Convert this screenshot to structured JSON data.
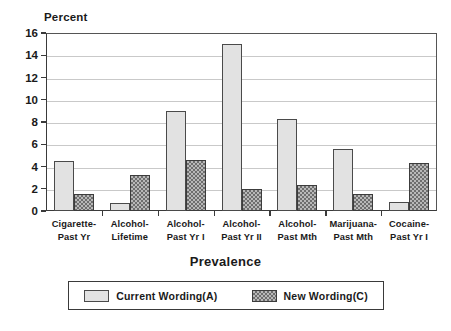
{
  "chart_data": {
    "type": "bar",
    "title": "",
    "xlabel": "Prevalence",
    "ylabel": "Percent",
    "ylim": [
      0,
      16
    ],
    "yticks": [
      0,
      2,
      4,
      6,
      8,
      10,
      12,
      14,
      16
    ],
    "grid": true,
    "legend_position": "bottom",
    "categories": [
      "Cigarette-Past Yr",
      "Alcohol-Lifetime",
      "Alcohol-Past Yr I",
      "Alcohol-Past Yr II",
      "Alcohol-Past Mth",
      "Marijuana-Past Mth",
      "Cocaine-Past Yr I"
    ],
    "category_lines": [
      [
        "Cigarette-",
        "Past Yr"
      ],
      [
        "Alcohol-",
        "Lifetime"
      ],
      [
        "Alcohol-",
        "Past Yr I"
      ],
      [
        "Alcohol-",
        "Past Yr II"
      ],
      [
        "Alcohol-",
        "Past Mth"
      ],
      [
        "Marijuana-",
        "Past Mth"
      ],
      [
        "Cocaine-",
        "Past Yr I"
      ]
    ],
    "series": [
      {
        "name": "Current Wording(A)",
        "values": [
          4.5,
          0.7,
          9.0,
          15.0,
          8.3,
          5.6,
          0.8
        ]
      },
      {
        "name": "New Wording(C)",
        "values": [
          1.5,
          3.2,
          4.6,
          2.0,
          2.3,
          1.5,
          4.3
        ]
      }
    ]
  },
  "legend": {
    "items": [
      {
        "label": "Current Wording(A)"
      },
      {
        "label": "New Wording(C)"
      }
    ]
  },
  "colors": {
    "series_a_fill": "#e2e2e2",
    "series_b_fill": "#b8b8b8",
    "axis": "#3a3a3a",
    "grid": "#c9c9c9"
  }
}
